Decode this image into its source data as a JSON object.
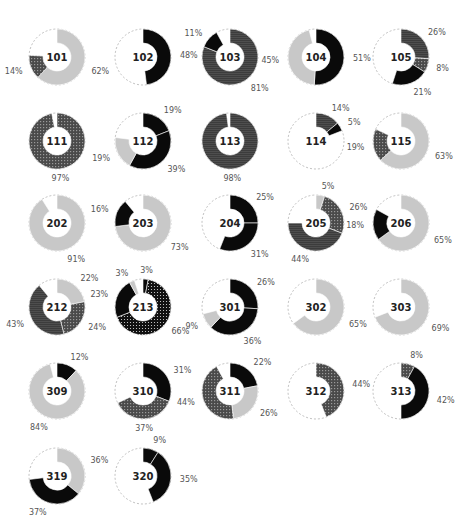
{
  "chart_data": {
    "type": "pie",
    "subtype": "donut-grid",
    "title": "",
    "layout": {
      "columns": 5,
      "rows": 6,
      "legend": "none",
      "grid": false
    },
    "fills": {
      "light": {
        "color": "#c8c8c8",
        "pattern": "solid"
      },
      "black": {
        "color": "#0a0a0a",
        "pattern": "solid"
      },
      "hstripe": {
        "color": "#3c3c3c",
        "pattern": "horizontal-lines"
      },
      "cross": {
        "color": "#555555",
        "pattern": "crosshatch"
      },
      "dots": {
        "color": "#111111",
        "pattern": "dots"
      }
    },
    "charts": [
      {
        "id": "101",
        "segments": [
          {
            "value": 62,
            "fill": "light",
            "label": "62%"
          },
          {
            "value": 14,
            "fill": "cross",
            "label": "14%"
          }
        ]
      },
      {
        "id": "102",
        "segments": [
          {
            "value": 48,
            "fill": "black",
            "label": "48%"
          }
        ]
      },
      {
        "id": "103",
        "segments": [
          {
            "value": 81,
            "fill": "hstripe",
            "label": "81%"
          },
          {
            "value": 11,
            "fill": "black",
            "label": "11%"
          }
        ]
      },
      {
        "id": "104",
        "segments": [
          {
            "value": 51,
            "fill": "black",
            "label": "51%"
          },
          {
            "value": 45,
            "fill": "light",
            "label": "45%"
          }
        ]
      },
      {
        "id": "105",
        "segments": [
          {
            "value": 26,
            "fill": "hstripe",
            "label": "26%"
          },
          {
            "value": 8,
            "fill": "cross",
            "label": "8%"
          },
          {
            "value": 21,
            "fill": "black",
            "label": "21%"
          }
        ]
      },
      {
        "id": "111",
        "segments": [
          {
            "value": 97,
            "fill": "cross",
            "label": "97%"
          }
        ]
      },
      {
        "id": "112",
        "segments": [
          {
            "value": 19,
            "fill": "black",
            "label": "19%"
          },
          {
            "value": 39,
            "fill": "black",
            "label": "39%"
          },
          {
            "value": 19,
            "fill": "light",
            "label": "19%"
          }
        ]
      },
      {
        "id": "113",
        "segments": [
          {
            "value": 98,
            "fill": "hstripe",
            "label": "98%"
          }
        ]
      },
      {
        "id": "114",
        "segments": [
          {
            "value": 14,
            "fill": "hstripe",
            "label": "14%"
          },
          {
            "value": 5,
            "fill": "black",
            "label": "5%"
          }
        ]
      },
      {
        "id": "115",
        "segments": [
          {
            "value": 63,
            "fill": "light",
            "label": "63%"
          },
          {
            "value": 19,
            "fill": "cross",
            "label": "19%"
          }
        ]
      },
      {
        "id": "202",
        "segments": [
          {
            "value": 91,
            "fill": "light",
            "label": "91%"
          }
        ]
      },
      {
        "id": "203",
        "segments": [
          {
            "value": 73,
            "fill": "light",
            "label": "73%"
          },
          {
            "value": 16,
            "fill": "black",
            "label": "16%"
          }
        ]
      },
      {
        "id": "204",
        "segments": [
          {
            "value": 25,
            "fill": "black",
            "label": "25%"
          },
          {
            "value": 31,
            "fill": "black",
            "label": "31%"
          }
        ]
      },
      {
        "id": "205",
        "segments": [
          {
            "value": 5,
            "fill": "light",
            "label": "5%"
          },
          {
            "value": 26,
            "fill": "cross",
            "label": "26%"
          },
          {
            "value": 44,
            "fill": "hstripe",
            "label": "44%"
          }
        ]
      },
      {
        "id": "206",
        "segments": [
          {
            "value": 65,
            "fill": "light",
            "label": "65%"
          },
          {
            "value": 18,
            "fill": "black",
            "label": "18%"
          }
        ]
      },
      {
        "id": "212",
        "segments": [
          {
            "value": 22,
            "fill": "light",
            "label": "22%"
          },
          {
            "value": 24,
            "fill": "cross",
            "label": "24%"
          },
          {
            "value": 43,
            "fill": "hstripe",
            "label": "43%"
          }
        ]
      },
      {
        "id": "213",
        "segments": [
          {
            "value": 3,
            "fill": "black",
            "label": "3%"
          },
          {
            "value": 66,
            "fill": "dots",
            "label": "66%"
          },
          {
            "value": 23,
            "fill": "black",
            "label": "23%"
          },
          {
            "value": 3,
            "fill": "light",
            "label": "3%"
          }
        ]
      },
      {
        "id": "301",
        "segments": [
          {
            "value": 26,
            "fill": "black",
            "label": "26%"
          },
          {
            "value": 36,
            "fill": "black",
            "label": "36%"
          },
          {
            "value": 9,
            "fill": "light",
            "label": "9%"
          }
        ]
      },
      {
        "id": "302",
        "segments": [
          {
            "value": 65,
            "fill": "light",
            "label": "65%"
          }
        ]
      },
      {
        "id": "303",
        "segments": [
          {
            "value": 69,
            "fill": "light",
            "label": "69%"
          }
        ]
      },
      {
        "id": "309",
        "segments": [
          {
            "value": 12,
            "fill": "black",
            "label": "12%"
          },
          {
            "value": 84,
            "fill": "light",
            "label": "84%"
          }
        ]
      },
      {
        "id": "310",
        "segments": [
          {
            "value": 31,
            "fill": "black",
            "label": "31%"
          },
          {
            "value": 37,
            "fill": "cross",
            "label": "37%"
          }
        ]
      },
      {
        "id": "311",
        "segments": [
          {
            "value": 22,
            "fill": "black",
            "label": "22%"
          },
          {
            "value": 26,
            "fill": "light",
            "label": "26%"
          },
          {
            "value": 44,
            "fill": "cross",
            "label": "44%"
          }
        ]
      },
      {
        "id": "312",
        "segments": [
          {
            "value": 44,
            "fill": "cross",
            "label": "44%"
          }
        ]
      },
      {
        "id": "313",
        "segments": [
          {
            "value": 8,
            "fill": "cross",
            "label": "8%"
          },
          {
            "value": 42,
            "fill": "black",
            "label": "42%"
          }
        ]
      },
      {
        "id": "319",
        "segments": [
          {
            "value": 36,
            "fill": "light",
            "label": "36%"
          },
          {
            "value": 37,
            "fill": "black",
            "label": "37%"
          }
        ]
      },
      {
        "id": "320",
        "segments": [
          {
            "value": 9,
            "fill": "black",
            "label": "9%"
          },
          {
            "value": 35,
            "fill": "black",
            "label": "35%"
          }
        ]
      }
    ]
  }
}
